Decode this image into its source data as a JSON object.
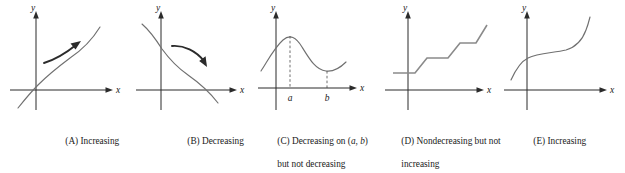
{
  "figure": {
    "axis_labels": {
      "x": "x",
      "y": "y"
    },
    "curve_color": "#707070",
    "axis_color": "#2b2b2b",
    "arrow_color": "#2b2b2b",
    "step_color": "#8a8a8a",
    "background": "#ffffff"
  },
  "panels": [
    {
      "id": "A",
      "caption": "(A) Increasing",
      "caption_lines": [
        "(A) Increasing"
      ],
      "x_label": "x",
      "y_label": "y",
      "has_arrow": true,
      "arrow_direction": "up-right",
      "tick_labels": [],
      "shape": "increasing-concave-down"
    },
    {
      "id": "B",
      "caption": "(B) Decreasing",
      "caption_lines": [
        "(B) Decreasing"
      ],
      "x_label": "x",
      "y_label": "y",
      "has_arrow": true,
      "arrow_direction": "down-right",
      "tick_labels": [],
      "shape": "decreasing-sigmoid"
    },
    {
      "id": "C",
      "caption": "(C) Decreasing on (a, b) but not decreasing everywhere",
      "caption_lines": [
        "(C) Decreasing on (a, b)",
        "but not decreasing",
        "everywhere"
      ],
      "x_label": "x",
      "y_label": "y",
      "has_arrow": false,
      "tick_labels": [
        "a",
        "b"
      ],
      "shape": "hump-then-valley"
    },
    {
      "id": "D",
      "caption": "(D) Nondecreasing but not increasing",
      "caption_lines": [
        "(D) Nondecreasing but not",
        "increasing"
      ],
      "x_label": "x",
      "y_label": "y",
      "has_arrow": false,
      "tick_labels": [],
      "shape": "staircase"
    },
    {
      "id": "E",
      "caption": "(E) Increasing",
      "caption_lines": [
        "(E) Increasing"
      ],
      "x_label": "x",
      "y_label": "y",
      "has_arrow": false,
      "tick_labels": [],
      "shape": "cubic-flat-middle"
    }
  ]
}
